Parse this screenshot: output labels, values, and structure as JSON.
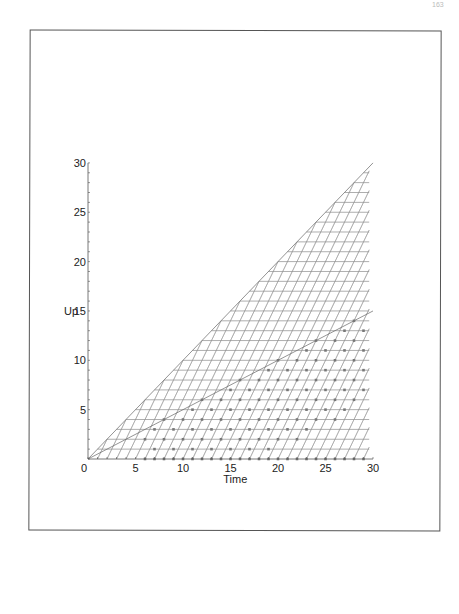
{
  "page": {
    "number": "163"
  },
  "chart_data": {
    "type": "line",
    "title": "",
    "xlabel": "Time",
    "ylabel": "Up",
    "xlim": [
      0,
      30
    ],
    "ylim": [
      0,
      30
    ],
    "x_ticks": [
      "0",
      "5",
      "10",
      "15",
      "20",
      "25",
      "30"
    ],
    "y_ticks": [
      "0",
      "5",
      "10",
      "15",
      "20",
      "25",
      "30"
    ],
    "grid": "lattice below diagonal Up = Time",
    "boundary_line": {
      "from": [
        0,
        0
      ],
      "to": [
        30,
        30
      ]
    },
    "reference_line": {
      "from": [
        0,
        0
      ],
      "to": [
        30,
        15
      ]
    },
    "horizontal_levels": [
      1,
      2,
      3,
      4,
      5,
      6,
      7,
      8,
      9,
      10,
      11,
      12,
      13,
      14,
      15,
      16,
      17,
      18,
      19,
      20,
      21,
      22,
      23,
      24,
      25,
      26,
      27,
      28,
      29
    ],
    "marked_points_note": "dots at lattice points below roughly Up < Time/2 region"
  }
}
